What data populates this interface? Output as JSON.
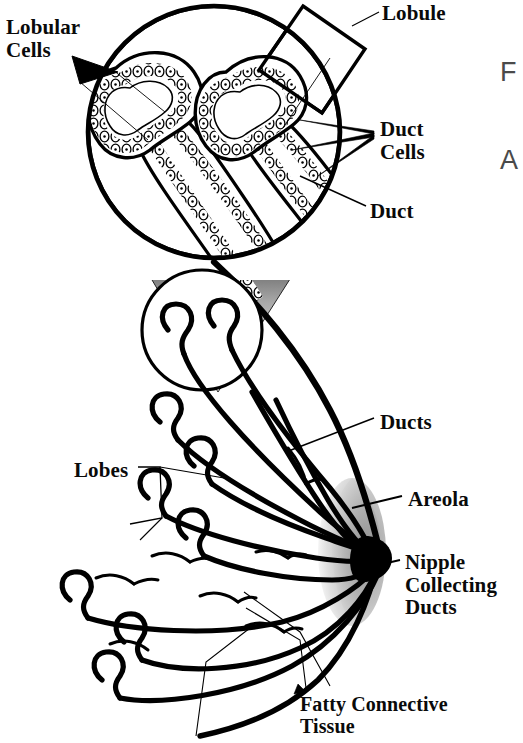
{
  "figure": {
    "type": "anatomical-diagram",
    "background_color": "#ffffff",
    "line_color": "#000000",
    "areola_color": "#b4b4b4"
  },
  "labels": {
    "lobular_cells": "Lobular\nCells",
    "lobule": "Lobule",
    "duct_cells": "Duct\nCells",
    "duct": "Duct",
    "ducts": "Ducts",
    "areola": "Areola",
    "nipple_collecting_ducts": "Nipple\nCollecting\nDucts",
    "lobes": "Lobes",
    "fatty_connective_tissue": "Fatty Connective\nTissue"
  },
  "edge_text": {
    "line1": "F",
    "line2": "A"
  },
  "inset": {
    "magnified_circle": {
      "cx": 214,
      "cy": 132,
      "r": 126
    },
    "source_circle": {
      "cx": 202,
      "cy": 330,
      "r": 60
    },
    "callout_box_label": "Lobule"
  }
}
